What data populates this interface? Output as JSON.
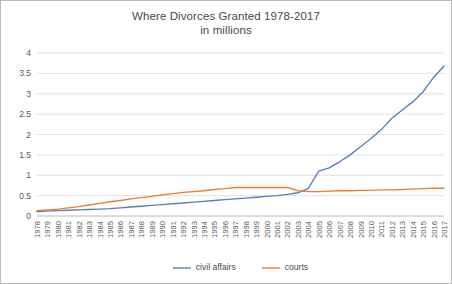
{
  "chart_data": {
    "type": "line",
    "title": "Where Divorces Granted 1978-2017",
    "subtitle": "in millions",
    "xlabel": "",
    "ylabel": "",
    "ylim": [
      0,
      4
    ],
    "yticks": [
      "0",
      "0.5",
      "1",
      "1.5",
      "2",
      "2.5",
      "3",
      "3.5",
      "4"
    ],
    "grid": true,
    "legend_position": "bottom",
    "categories": [
      "1978",
      "1979",
      "1980",
      "1981",
      "1982",
      "1983",
      "1984",
      "1985",
      "1986",
      "1987",
      "1988",
      "1989",
      "1990",
      "1991",
      "1992",
      "1993",
      "1994",
      "1995",
      "1996",
      "1997",
      "1998",
      "1999",
      "2000",
      "2001",
      "2002",
      "2003",
      "2004",
      "2005",
      "2006",
      "2007",
      "2008",
      "2009",
      "2010",
      "2011",
      "2012",
      "2013",
      "2014",
      "2015",
      "2016",
      "2017"
    ],
    "series": [
      {
        "name": "civil affairs",
        "color": "#5b7cb8",
        "values": [
          0.11,
          0.12,
          0.13,
          0.14,
          0.15,
          0.16,
          0.17,
          0.18,
          0.2,
          0.22,
          0.24,
          0.26,
          0.28,
          0.3,
          0.32,
          0.34,
          0.36,
          0.38,
          0.4,
          0.42,
          0.44,
          0.46,
          0.48,
          0.5,
          0.53,
          0.57,
          0.68,
          1.1,
          1.18,
          1.33,
          1.5,
          1.7,
          1.9,
          2.12,
          2.4,
          2.6,
          2.8,
          3.05,
          3.4,
          3.68
        ]
      },
      {
        "name": "courts",
        "color": "#ed7d31",
        "values": [
          0.13,
          0.15,
          0.17,
          0.2,
          0.23,
          0.27,
          0.31,
          0.35,
          0.38,
          0.42,
          0.45,
          0.48,
          0.52,
          0.55,
          0.58,
          0.6,
          0.62,
          0.65,
          0.67,
          0.7,
          0.7,
          0.7,
          0.7,
          0.7,
          0.7,
          0.62,
          0.6,
          0.6,
          0.61,
          0.62,
          0.62,
          0.63,
          0.63,
          0.64,
          0.64,
          0.65,
          0.66,
          0.67,
          0.68,
          0.68
        ]
      }
    ]
  }
}
